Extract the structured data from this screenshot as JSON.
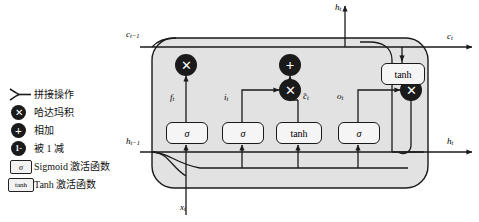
{
  "figure": {
    "type": "lstm-cell-diagram",
    "background": "#ffffff",
    "cell_fill": "#e2e2e2",
    "stroke": "#1a1a1a"
  },
  "legend": {
    "items": [
      {
        "icon": "concat-fork-icon",
        "label": "拼接操作"
      },
      {
        "icon": "hadamard-product-icon",
        "glyph": "✕",
        "label": "哈达玛积"
      },
      {
        "icon": "plus-circle-icon",
        "glyph": "+",
        "label": "相加"
      },
      {
        "icon": "one-minus-icon",
        "glyph": "1-",
        "label": "被 1 减"
      },
      {
        "icon": "sigmoid-box-icon",
        "glyph": "σ",
        "label": "Sigmoid 激活函数"
      },
      {
        "icon": "tanh-box-icon",
        "glyph": "tanh",
        "label": "Tanh 激活函数"
      }
    ]
  },
  "diagram": {
    "inputs": [
      {
        "name": "cell-state-in",
        "text": "c",
        "sub": "t−1",
        "x": 126,
        "y": 30
      },
      {
        "name": "hidden-state-in",
        "text": "h",
        "sub": "t−1",
        "x": 126,
        "y": 137
      },
      {
        "name": "data-input",
        "text": "x",
        "sub": "t",
        "x": 180,
        "y": 203
      }
    ],
    "outputs": [
      {
        "name": "cell-state-out",
        "text": "c",
        "sub": "t",
        "x": 447,
        "y": 32
      },
      {
        "name": "hidden-state-out-top",
        "text": "h",
        "sub": "t",
        "x": 335,
        "y": 3
      },
      {
        "name": "hidden-state-out-right",
        "text": "h",
        "sub": "t",
        "x": 447,
        "y": 137
      }
    ],
    "gate_labels": [
      {
        "name": "forget-gate-label",
        "text": "f",
        "sub": "t",
        "x": 170,
        "y": 93
      },
      {
        "name": "input-gate-label",
        "text": "i",
        "sub": "t",
        "x": 224,
        "y": 93
      },
      {
        "name": "candidate-label",
        "text": "̃c",
        "sub": "t",
        "x": 303,
        "y": 92
      },
      {
        "name": "output-gate-label",
        "text": "o",
        "sub": "t",
        "x": 337,
        "y": 92
      }
    ],
    "activation_boxes": [
      {
        "name": "forget-sigmoid-box",
        "glyph": "σ",
        "italic": true,
        "x": 166,
        "y": 122,
        "w": 40,
        "h": 20
      },
      {
        "name": "input-sigmoid-box",
        "glyph": "σ",
        "italic": true,
        "x": 222,
        "y": 122,
        "w": 40,
        "h": 20
      },
      {
        "name": "candidate-tanh-box",
        "glyph": "tanh",
        "italic": false,
        "x": 276,
        "y": 122,
        "w": 44,
        "h": 20
      },
      {
        "name": "output-sigmoid-box",
        "glyph": "σ",
        "italic": true,
        "x": 338,
        "y": 122,
        "w": 40,
        "h": 20
      },
      {
        "name": "state-tanh-box",
        "glyph": "tanh",
        "italic": false,
        "x": 381,
        "y": 63,
        "w": 42,
        "h": 20
      }
    ],
    "operators": [
      {
        "name": "forget-multiply-node",
        "glyph": "✕",
        "cx": 186,
        "cy": 65
      },
      {
        "name": "state-add-node",
        "glyph": "+",
        "cx": 290,
        "cy": 65
      },
      {
        "name": "candidate-multiply-node",
        "glyph": "✕",
        "cx": 290,
        "cy": 90
      },
      {
        "name": "output-multiply-node",
        "glyph": "✕",
        "cx": 411,
        "cy": 90
      }
    ]
  }
}
